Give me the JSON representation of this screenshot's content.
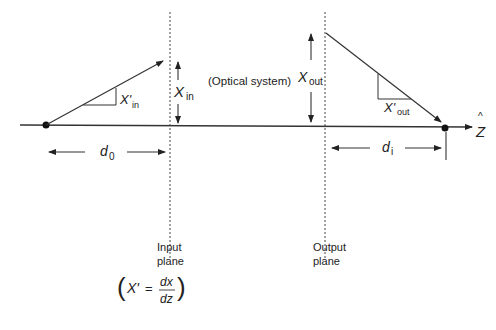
{
  "diagram": {
    "type": "optical-system-ray-diagram",
    "axis": {
      "label": "Z",
      "hat": "^"
    },
    "center_label": "(Optical system)",
    "input_plane": {
      "line1": "Input",
      "line2": "plane"
    },
    "output_plane": {
      "line1": "Output",
      "line2": "plane"
    },
    "x_in": {
      "main": "X",
      "sub": "in"
    },
    "x_in_prime": {
      "main": "X'",
      "sub": "in"
    },
    "x_out": {
      "main": "X",
      "sub": "out"
    },
    "x_out_prime": {
      "main": "X'",
      "sub": "out"
    },
    "d0": {
      "main": "d",
      "sub": "0"
    },
    "di": {
      "main": "d",
      "sub": "i"
    },
    "formula": {
      "open_paren": "(",
      "lhs": "X'",
      "equals": "=",
      "numerator": "dx",
      "denominator": "dz",
      "close_paren": ")"
    }
  }
}
